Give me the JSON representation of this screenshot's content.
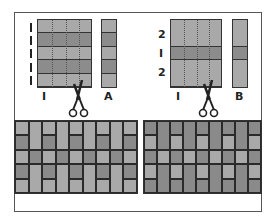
{
  "colors": {
    "light": "#a9a9a9",
    "dark": "#8a8a8a",
    "mid": "#9a9a9a",
    "line": "#333333",
    "frame": "#555555"
  },
  "left_diagram": {
    "strip_set_label": "I",
    "cut_strip_label": "A",
    "row_width_marks": [
      "I",
      "I",
      "I",
      "I",
      "I"
    ],
    "bands": [
      "light",
      "dark",
      "light",
      "dark",
      "light"
    ]
  },
  "right_diagram": {
    "strip_set_label": "I",
    "cut_strip_label": "B",
    "row_width_marks": [
      "2",
      "I",
      "2"
    ],
    "bands": [
      "light",
      "dark",
      "light"
    ]
  },
  "left_quilt": {
    "columns": 9,
    "pattern_A_column": [
      "light",
      "dark",
      "light",
      "dark",
      "light"
    ],
    "pattern_B_column": [
      {
        "tone": "light",
        "span": 2
      },
      {
        "tone": "dark",
        "span": 1
      },
      {
        "tone": "light",
        "span": 2
      }
    ]
  },
  "right_quilt": {
    "columns": 9,
    "pattern_A_column": [
      "dark",
      "light",
      "dark",
      "light",
      "dark"
    ],
    "pattern_B_column": [
      {
        "tone": "dark",
        "span": 2
      },
      {
        "tone": "light",
        "span": 1
      },
      {
        "tone": "dark",
        "span": 2
      }
    ]
  }
}
